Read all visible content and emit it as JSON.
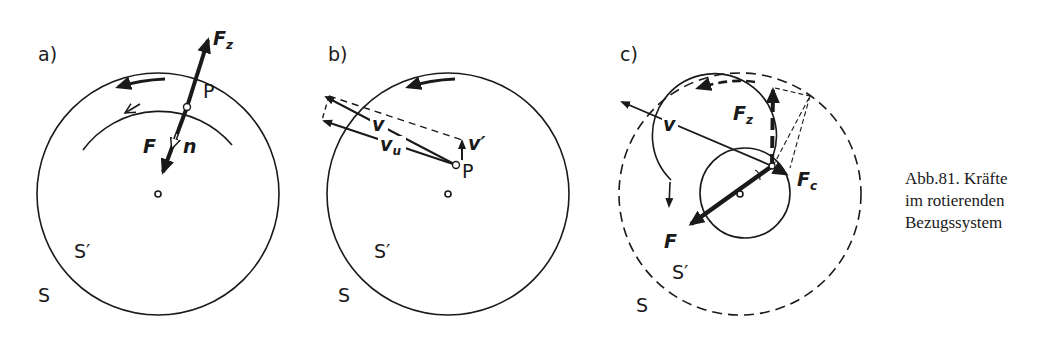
{
  "figure": {
    "panels": [
      {
        "id": "a",
        "label": "a)",
        "labels": {
          "S": "S",
          "S_prime": "S′",
          "P": "P",
          "F": "F",
          "n": "n",
          "Fz": "F",
          "Fz_sub": "z"
        }
      },
      {
        "id": "b",
        "label": "b)",
        "labels": {
          "S": "S",
          "S_prime": "S′",
          "P": "P",
          "v": "v",
          "vu": "v",
          "vu_sub": "u",
          "v_prime": "v′"
        }
      },
      {
        "id": "c",
        "label": "c)",
        "labels": {
          "S": "S",
          "S_prime": "S′",
          "v": "v",
          "F": "F",
          "Fz": "F",
          "Fz_sub": "z",
          "Fc": "F",
          "Fc_sub": "c"
        }
      }
    ],
    "caption": {
      "line1": "Abb.81. Kräfte",
      "line2": "im rotierenden",
      "line3": "Bezugssystem"
    },
    "colors": {
      "ink": "#1a1a1a",
      "background": "#ffffff"
    }
  }
}
